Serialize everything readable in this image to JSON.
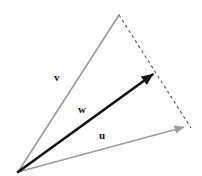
{
  "figure": {
    "background_color": "#ffffff",
    "width": 202,
    "height": 176
  },
  "labels": {
    "v": "v",
    "w": "w",
    "u": "u"
  },
  "top_artifacts": {
    "mark_left": "·",
    "mark_mid": "·",
    "mark_right": "·",
    "mark_center": "·"
  },
  "chart_data": {
    "type": "diagram",
    "origin": {
      "x": 18,
      "y": 172
    },
    "vectors": [
      {
        "name": "v",
        "label": "v",
        "color": "#9a9a9a",
        "style": "solid",
        "width": 1.6,
        "arrowhead": false,
        "from": {
          "x": 18,
          "y": 172
        },
        "to": {
          "x": 119,
          "y": 15
        },
        "label_pos": {
          "x": 58,
          "y": 78
        }
      },
      {
        "name": "u",
        "label": "u",
        "color": "#9a9a9a",
        "style": "solid",
        "width": 1.6,
        "arrowhead": true,
        "from": {
          "x": 18,
          "y": 172
        },
        "to": {
          "x": 188,
          "y": 126
        },
        "label_pos": {
          "x": 103,
          "y": 136
        }
      },
      {
        "name": "w",
        "label": "w",
        "color": "#111111",
        "style": "solid",
        "width": 2.6,
        "arrowhead": true,
        "from": {
          "x": 18,
          "y": 172
        },
        "to": {
          "x": 156,
          "y": 72
        },
        "label_pos": {
          "x": 82,
          "y": 110
        }
      }
    ],
    "construction_lines": [
      {
        "name": "dashed-apex-to-u-tip",
        "color": "#555555",
        "style": "dashed",
        "dash_pattern": "3,3",
        "width": 1.1,
        "from": {
          "x": 119,
          "y": 15
        },
        "to": {
          "x": 191,
          "y": 128
        }
      }
    ]
  }
}
